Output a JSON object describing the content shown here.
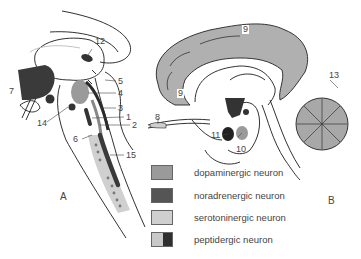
{
  "figure": {
    "panels": [
      {
        "id": "A",
        "label": "A"
      },
      {
        "id": "B",
        "label": "B"
      }
    ],
    "labels_A": [
      "12",
      "5",
      "4",
      "3",
      "1",
      "2",
      "7",
      "14",
      "6",
      "15"
    ],
    "labels_B": [
      "9",
      "9",
      "13",
      "8",
      "11",
      "10"
    ],
    "colors": {
      "dopaminergic": "#9a9a9a",
      "noradrenergic": "#555555",
      "serotoninergic": "#cfcfcf",
      "peptidergic_light": "#c8c8c8",
      "peptidergic_dark": "#2e2e2e",
      "outline": "#1a1a1a"
    }
  },
  "legend": {
    "items": [
      {
        "label": "dopaminergic neuron"
      },
      {
        "label": "noradrenergic neuron"
      },
      {
        "label": "serotoninergic neuron"
      },
      {
        "label": "peptidergic neuron"
      }
    ]
  }
}
